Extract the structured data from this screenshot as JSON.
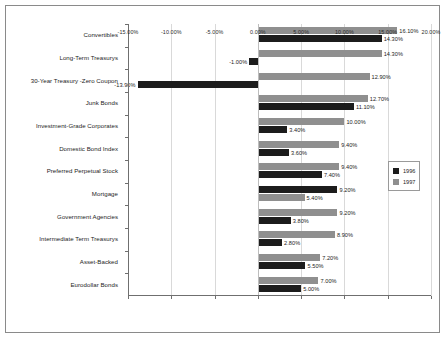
{
  "chart_data": {
    "type": "bar",
    "orientation": "horizontal",
    "title": "",
    "xlabel": "",
    "ylabel": "",
    "xlim": [
      -15,
      20
    ],
    "xticks": [
      -15,
      -10,
      -5,
      0,
      5,
      10,
      15,
      20
    ],
    "xtick_labels": [
      "-15.00%",
      "-10.00%",
      "-5.00%",
      "0.00%",
      "5.00%",
      "10.00%",
      "15.00%",
      "20.00%"
    ],
    "grid": true,
    "grid_axis": "x",
    "legend_position": "right",
    "value_format": "percent",
    "categories": [
      "Convertibles",
      "Long-Term Treasurys",
      "30-Year Treasury -Zero Coupon",
      "Junk Bonds",
      "Investment-Grade Corporates",
      "Domestic Bond Index",
      "Preferred Perpetual Stock",
      "Mortgage",
      "Government Agencies",
      "Intermediate Term Treasurys",
      "Asset-Backed",
      "Eurodollar Bonds"
    ],
    "series": [
      {
        "name": "1996",
        "color": "#1c1c1c",
        "values": [
          14.3,
          -1.0,
          -13.9,
          11.1,
          3.4,
          3.6,
          7.4,
          9.2,
          3.8,
          2.8,
          5.5,
          5.0
        ],
        "labels": [
          "14.30%",
          "-1.00%",
          "-13.90%",
          "11.10%",
          "3.40%",
          "3.60%",
          "7.40%",
          "9.20%",
          "3.80%",
          "2.80%",
          "5.50%",
          "5.00%"
        ]
      },
      {
        "name": "1997",
        "color": "#8f8f8f",
        "values": [
          16.1,
          14.3,
          12.9,
          12.7,
          10.0,
          9.4,
          9.4,
          5.4,
          9.2,
          8.9,
          7.2,
          7.0
        ],
        "labels": [
          "16.10%",
          "14.30%",
          "12.90%",
          "12.70%",
          "10.00%",
          "9.40%",
          "9.40%",
          "5.40%",
          "9.20%",
          "8.90%",
          "7.20%",
          "7.00%"
        ]
      }
    ],
    "row_top_series": [
      "1997",
      "1997",
      "1997",
      "1997",
      "1997",
      "1997",
      "1997",
      "1996",
      "1997",
      "1997",
      "1997",
      "1997"
    ]
  },
  "legend": {
    "entries": [
      {
        "label": "1996",
        "color": "#1c1c1c"
      },
      {
        "label": "1997",
        "color": "#8f8f8f"
      }
    ]
  }
}
